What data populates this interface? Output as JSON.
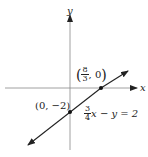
{
  "diagram": {
    "type": "cartesian-line-graph",
    "axes": {
      "x_label": "x",
      "y_label": "y"
    },
    "line": {
      "equation_lhs_fraction": {
        "numerator": "3",
        "denominator": "4"
      },
      "equation_rest": "x − y = 2",
      "equation_text": "3/4 x − y = 2",
      "color": "#222222"
    },
    "points": [
      {
        "name": "x-intercept",
        "label_fraction": {
          "numerator": "8",
          "denominator": "3"
        },
        "label_rest": ", 0",
        "label_text": "(8/3, 0)",
        "x": 2.6667,
        "y": 0
      },
      {
        "name": "y-intercept",
        "label_text": "(0, −2)",
        "x": 0,
        "y": -2
      }
    ]
  }
}
